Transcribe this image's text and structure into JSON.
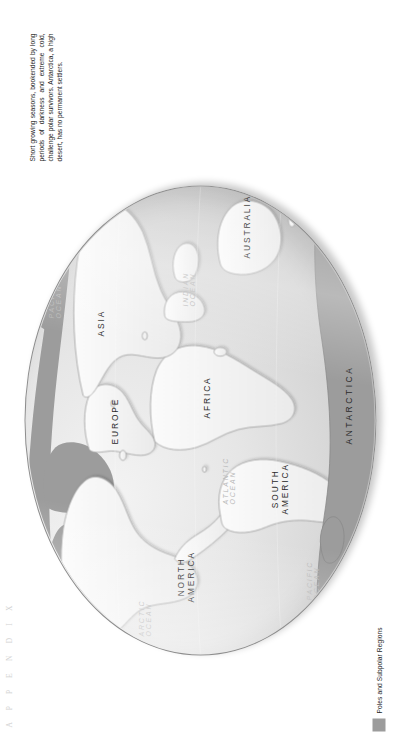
{
  "page": {
    "running_head": "A P P E N D I X",
    "caption": "Short growing seasons, bookended by long periods of darkness and extreme cold, challenge polar survivors. Antarctica, a high desert, has no permanent settlers."
  },
  "legend": {
    "label": "Poles and Subpolar Regions",
    "swatch_color": "#9c9c9c"
  },
  "map": {
    "type": "world-map",
    "projection": "oval / elliptical world",
    "highlight_color": "#9c9c9c",
    "land_color": "#f2f2f2",
    "ocean_color": "#e2e2e2",
    "continents": [
      {
        "name": "NORTH AMERICA",
        "line1": "NORTH",
        "line2": "AMERICA"
      },
      {
        "name": "SOUTH AMERICA",
        "line1": "SOUTH",
        "line2": "AMERICA"
      },
      {
        "name": "EUROPE",
        "line1": "EUROPE",
        "line2": ""
      },
      {
        "name": "AFRICA",
        "line1": "AFRICA",
        "line2": ""
      },
      {
        "name": "ASIA",
        "line1": "ASIA",
        "line2": ""
      },
      {
        "name": "AUSTRALIA",
        "line1": "AUSTRALIA",
        "line2": ""
      },
      {
        "name": "ANTARCTICA",
        "line1": "ANTARCTICA",
        "line2": ""
      }
    ],
    "oceans": [
      {
        "name": "ARCTIC OCEAN",
        "line1": "ARCTIC",
        "line2": "OCEAN"
      },
      {
        "name": "ATLANTIC OCEAN",
        "line1": "ATLANTIC",
        "line2": "OCEAN"
      },
      {
        "name": "PACIFIC OCEAN (north)",
        "line1": "PACIFIC",
        "line2": "OCEAN"
      },
      {
        "name": "PACIFIC OCEAN (south)",
        "line1": "PACIFIC",
        "line2": "OCEAN"
      },
      {
        "name": "INDIAN OCEAN",
        "line1": "INDIAN",
        "line2": "OCEAN"
      }
    ]
  }
}
